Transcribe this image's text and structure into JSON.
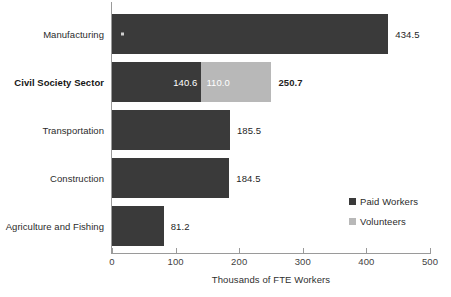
{
  "chart_data": {
    "type": "bar",
    "orientation": "horizontal",
    "stacked": true,
    "title": "",
    "subtitle": "",
    "xlabel": "Thousands of FTE Workers",
    "ylabel": "",
    "xlim": [
      0,
      500
    ],
    "xticks": [
      "0",
      "100",
      "200",
      "300",
      "400",
      "500"
    ],
    "xtick_values": [
      0,
      100,
      200,
      300,
      400,
      500
    ],
    "grid": false,
    "legend_position": "inside-right-lower",
    "categories": [
      "Manufacturing",
      "Civil Society Sector",
      "Transportation",
      "Construction",
      "Agriculture and Fishing"
    ],
    "highlight_category": "Civil Society Sector",
    "series": [
      {
        "name": "Paid Workers",
        "color": "#3a3a3a",
        "values": [
          434.5,
          140.6,
          185.5,
          184.5,
          81.2
        ]
      },
      {
        "name": "Volunteers",
        "color": "#b8b8b8",
        "values": [
          0,
          110.0,
          0,
          0,
          0
        ]
      }
    ],
    "totals": [
      434.5,
      250.7,
      185.5,
      184.5,
      81.2
    ],
    "rows": [
      {
        "category": "Manufacturing",
        "bold": false,
        "paid": 434.5,
        "volunteers": 0,
        "total": 434.5,
        "paid_label": "",
        "volunteers_label": "",
        "total_label": "434.5",
        "total_bold": false
      },
      {
        "category": "Civil Society Sector",
        "bold": true,
        "paid": 140.6,
        "volunteers": 110.0,
        "total": 250.7,
        "paid_label": "140.6",
        "volunteers_label": "110.0",
        "total_label": "250.7",
        "total_bold": true
      },
      {
        "category": "Transportation",
        "bold": false,
        "paid": 185.5,
        "volunteers": 0,
        "total": 185.5,
        "paid_label": "",
        "volunteers_label": "",
        "total_label": "185.5",
        "total_bold": false
      },
      {
        "category": "Construction",
        "bold": false,
        "paid": 184.5,
        "volunteers": 0,
        "total": 184.5,
        "paid_label": "",
        "volunteers_label": "",
        "total_label": "184.5",
        "total_bold": false
      },
      {
        "category": "Agriculture and Fishing",
        "bold": false,
        "paid": 81.2,
        "volunteers": 0,
        "total": 81.2,
        "paid_label": "",
        "volunteers_label": "",
        "total_label": "81.2",
        "total_bold": false
      }
    ],
    "legend": [
      {
        "label": "Paid Workers",
        "color": "#3a3a3a"
      },
      {
        "label": "Volunteers",
        "color": "#b8b8b8"
      }
    ],
    "colors": {
      "paid_workers": "#3a3a3a",
      "volunteers": "#b8b8b8",
      "axis": "#9a9a9a",
      "text": "#2b2b2b",
      "background": "#ffffff"
    }
  }
}
